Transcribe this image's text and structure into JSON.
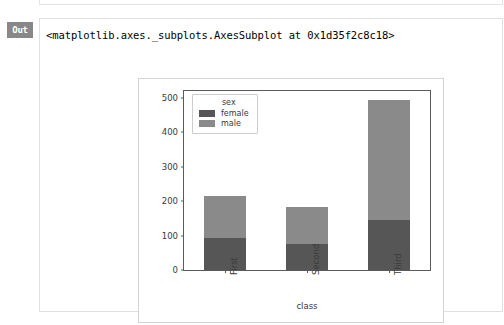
{
  "notebook": {
    "out_prompt": "Out",
    "out_text": "<matplotlib.axes._subplots.AxesSubplot at 0x1d35f2c8c18>"
  },
  "chart_data": {
    "type": "bar",
    "stacked": true,
    "title": "",
    "xlabel": "class",
    "ylabel": "",
    "categories": [
      "First",
      "Second",
      "Third"
    ],
    "series": [
      {
        "name": "female",
        "values": [
          94,
          76,
          146
        ],
        "color": "#565656"
      },
      {
        "name": "male",
        "values": [
          122,
          108,
          347
        ],
        "color": "#8a8a8a"
      }
    ],
    "totals": [
      216,
      184,
      493
    ],
    "legend": {
      "title": "sex",
      "position": "upper left",
      "entries": [
        "female",
        "male"
      ]
    },
    "yticks": [
      0,
      100,
      200,
      300,
      400,
      500
    ],
    "ytick_labels": [
      "0",
      "100",
      "200",
      "300",
      "400",
      "500"
    ],
    "ylim": [
      0,
      520
    ],
    "xtick_labels": [
      "First",
      "Second",
      "Third"
    ],
    "xtick_rotation": 90,
    "grid": false
  }
}
